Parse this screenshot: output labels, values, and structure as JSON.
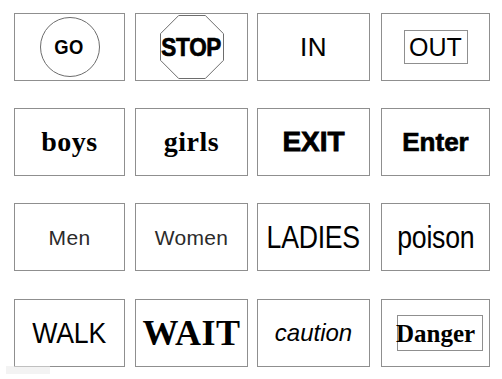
{
  "page": {
    "background_color": "#ffffff",
    "text_color": "#000000",
    "border_color": "#8f8f8f",
    "rows": 4,
    "columns": 4
  },
  "cards": [
    [
      {
        "text": "GO",
        "style": "sans-bold-condensed",
        "decoration": "circle-outline"
      },
      {
        "text": "STOP",
        "style": "sans-heavy-condensed",
        "decoration": "octagon-outline"
      },
      {
        "text": "IN",
        "style": "sans-light",
        "decoration": "none"
      },
      {
        "text": "OUT",
        "style": "sans-regular",
        "decoration": "inner-rectangle"
      }
    ],
    [
      {
        "text": "boys",
        "style": "serif-bold",
        "decoration": "none"
      },
      {
        "text": "girls",
        "style": "serif-bold",
        "decoration": "none"
      },
      {
        "text": "EXIT",
        "style": "sans-heavy",
        "decoration": "none"
      },
      {
        "text": "Enter",
        "style": "sans-heavy",
        "decoration": "none"
      }
    ],
    [
      {
        "text": "Men",
        "style": "sans-regular-small",
        "decoration": "none"
      },
      {
        "text": "Women",
        "style": "sans-regular-small",
        "decoration": "none"
      },
      {
        "text": "LADIES",
        "style": "sans-condensed-large",
        "decoration": "none"
      },
      {
        "text": "poison",
        "style": "sans-condensed-large",
        "decoration": "none"
      }
    ],
    [
      {
        "text": "WALK",
        "style": "sans-regular-large",
        "decoration": "none"
      },
      {
        "text": "WAIT",
        "style": "serif-bold-large",
        "decoration": "none"
      },
      {
        "text": "caution",
        "style": "sans-italic",
        "decoration": "none"
      },
      {
        "text": "Danger",
        "style": "serif-bold",
        "decoration": "inner-rectangle"
      }
    ]
  ]
}
